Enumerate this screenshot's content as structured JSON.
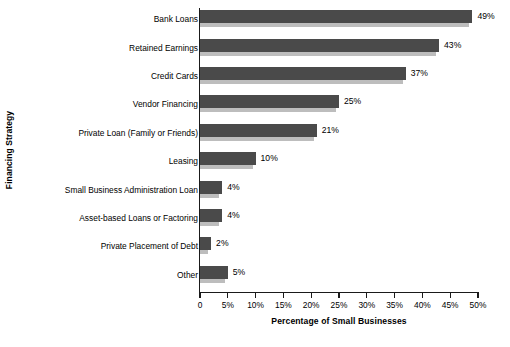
{
  "chart_data": {
    "type": "bar",
    "orientation": "horizontal",
    "title": "",
    "xlabel": "Percentage of Small Businesses",
    "ylabel": "Financing Strategy",
    "xlim": [
      0,
      50
    ],
    "grid": false,
    "legend": null,
    "categories": [
      "Bank Loans",
      "Retained Earnings",
      "Credit Cards",
      "Vendor Financing",
      "Private Loan (Family or Friends)",
      "Leasing",
      "Small Business  Administration Loan",
      "Asset-based Loans or Factoring",
      "Private Placement of Debt",
      "Other"
    ],
    "values": [
      49,
      43,
      37,
      25,
      21,
      10,
      4,
      4,
      2,
      5
    ],
    "value_labels": [
      "49%",
      "43%",
      "37%",
      "25%",
      "21%",
      "10%",
      "4%",
      "4%",
      "2%",
      "5%"
    ],
    "xticks": [
      0,
      5,
      10,
      15,
      20,
      25,
      30,
      35,
      40,
      45,
      50
    ],
    "xtick_labels": [
      "0",
      "5%",
      "10%",
      "15%",
      "20%",
      "25%",
      "30%",
      "35%",
      "40%",
      "45%",
      "50%"
    ],
    "colors": {
      "bar": "#4a4a4a",
      "bar_shadow": "#bdbdbd",
      "axis": "#1a1a1a",
      "background": "#ffffff",
      "text": "#000000"
    }
  }
}
